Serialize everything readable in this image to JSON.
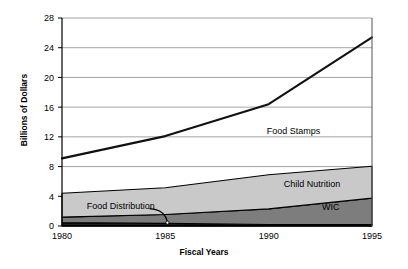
{
  "chart_data": {
    "type": "area",
    "title": "",
    "xlabel": "Fiscal Years",
    "ylabel": "Billions of Dollars",
    "x": [
      1980,
      1985,
      1990,
      1995
    ],
    "xtick_labels": [
      "1980",
      "1985",
      "1990",
      "1995"
    ],
    "ytick_labels": [
      "0",
      "4",
      "8",
      "12",
      "16",
      "20",
      "24",
      "28"
    ],
    "ytick_values": [
      0,
      4,
      8,
      12,
      16,
      20,
      24,
      28
    ],
    "ylim": [
      0,
      28
    ],
    "xlim": [
      1980,
      1995
    ],
    "grid": "horizontal",
    "legend_position": "inline-annotations",
    "series": [
      {
        "name": "Food Stamps",
        "render": "line",
        "color": "#111111",
        "values": [
          9.1,
          12.1,
          16.4,
          25.4
        ],
        "label_x": 1991.2,
        "label_y": 12.4
      },
      {
        "name": "Child Nutrition",
        "render": "stacked-area",
        "color": "#c9c9c9",
        "values": [
          3.2,
          3.6,
          4.6,
          4.3
        ],
        "label_x": 1992.1,
        "label_y": 5.3
      },
      {
        "name": "WIC",
        "render": "stacked-area",
        "color": "#7d7d7d",
        "values": [
          0.75,
          1.2,
          2.1,
          3.55
        ],
        "label_x": 1993.0,
        "label_y": 2.2
      },
      {
        "name": "Food Distribution",
        "render": "stacked-area",
        "color": "#1c1c1c",
        "values": [
          0.45,
          0.35,
          0.2,
          0.2
        ],
        "label_x": 1981.2,
        "label_y": 2.35
      }
    ],
    "stack_totals": [
      4.4,
      5.15,
      6.9,
      8.05
    ],
    "annotations": [
      {
        "text": "Food Distribution",
        "leader_line": true,
        "points_to_x": 1985.1,
        "points_to_y": 0.45
      }
    ]
  },
  "axes": {
    "y_title": "Billions of Dollars",
    "x_title": "Fiscal Years"
  },
  "labels": {
    "food_stamps": "Food Stamps",
    "child_nutrition": "Child Nutrition",
    "wic": "WIC",
    "food_distribution": "Food Distribution"
  },
  "colors": {
    "background": "#ffffff",
    "axis": "#000000",
    "grid": "#9a9a9a",
    "food_stamps_line": "#111111",
    "child_nutrition_fill": "#c9c9c9",
    "wic_fill": "#7d7d7d",
    "food_distribution_fill": "#1c1c1c"
  }
}
